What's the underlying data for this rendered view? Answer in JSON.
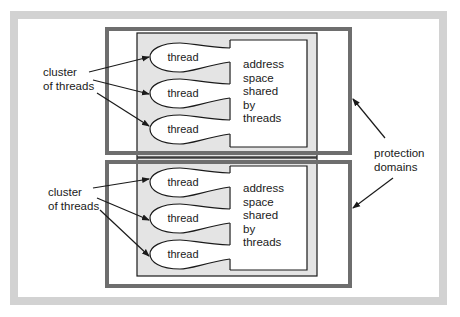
{
  "diagram": {
    "colors": {
      "frame": "#d2d2d2",
      "domain_border": "#6e6e6e",
      "cluster_fill": "#e4e4e4",
      "line": "#1a1a1a",
      "background": "#ffffff"
    },
    "protection_domains": [
      {
        "cluster_label_line1": "cluster",
        "cluster_label_line2": "of threads",
        "threads": [
          {
            "label": "thread"
          },
          {
            "label": "thread"
          },
          {
            "label": "thread"
          }
        ],
        "address_space_label": "address\nspace\nshared\nby\nthreads"
      },
      {
        "cluster_label_line1": "cluster",
        "cluster_label_line2": "of threads",
        "threads": [
          {
            "label": "thread"
          },
          {
            "label": "thread"
          },
          {
            "label": "thread"
          }
        ],
        "address_space_label": "address\nspace\nshared\nby\nthreads"
      }
    ],
    "protection_label_line1": "protection",
    "protection_label_line2": "domains"
  }
}
